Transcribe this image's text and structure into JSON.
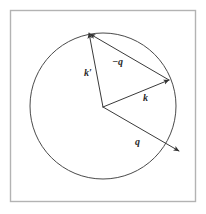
{
  "figure": {
    "background_color": "#ffffff",
    "frame": {
      "name": "figure-border",
      "x": 10.5,
      "y": 10.5,
      "width": 185,
      "height": 191,
      "stroke_color": "#b3b3b3",
      "stroke_width": 1.4
    },
    "circle": {
      "name": "fermi-circle",
      "cx": 103,
      "cy": 106,
      "r": 73,
      "stroke_color": "#4a4a4a",
      "stroke_width": 1.0,
      "fill": "none"
    },
    "origin": {
      "x": 103,
      "y": 107
    },
    "stroke_color": "#3a3a3a",
    "stroke_width": 1.0,
    "vectors": [
      {
        "id": "k-prime",
        "label": "k′",
        "label_plain": "k'",
        "description": "outgoing wavevector from origin to circle, up and slightly left",
        "x1": 103,
        "y1": 107,
        "x2": 89,
        "y2": 33,
        "label_x": 84,
        "label_y": 76,
        "arrowhead": true
      },
      {
        "id": "k",
        "label": "k",
        "label_plain": "k",
        "description": "incoming wavevector from origin to circle, up and right",
        "x1": 103,
        "y1": 107,
        "x2": 169,
        "y2": 80,
        "label_x": 143,
        "label_y": 101,
        "arrowhead": true
      },
      {
        "id": "minus-q",
        "label": "−q",
        "label_plain": "-q",
        "description": "momentum transfer reversed, from tip of k to tip of k-prime",
        "x1": 169,
        "y1": 80,
        "x2": 90,
        "y2": 34,
        "label_x": 112,
        "label_y": 65,
        "arrowhead": true
      },
      {
        "id": "q",
        "label": "q",
        "label_plain": "q",
        "description": "momentum transfer from origin outward past the circle, down and right",
        "x1": 103,
        "y1": 107,
        "x2": 179,
        "y2": 151,
        "label_x": 135,
        "label_y": 145,
        "arrowhead": true
      }
    ]
  }
}
